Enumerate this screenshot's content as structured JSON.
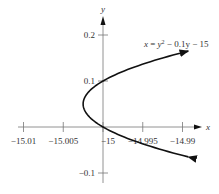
{
  "chart_data": {
    "type": "line",
    "title": "",
    "equation_label": "x = y² − 0.1y − 15",
    "xlabel": "x",
    "ylabel": "y",
    "xlim": [
      -15.0125,
      -14.988
    ],
    "ylim": [
      -0.12,
      0.24
    ],
    "x_ticks": [
      -15.01,
      -15.005,
      -15,
      -14.995,
      -14.99
    ],
    "x_tick_labels": [
      "−15.01",
      "−15.005",
      "−15",
      "−14.995",
      "−14.99"
    ],
    "y_ticks": [
      -0.1,
      0.1,
      0.2
    ],
    "y_tick_labels": [
      "−0.1",
      "0.1",
      "0.2"
    ],
    "grid": false,
    "legend": null,
    "series": [
      {
        "name": "x = y^2 - 0.1y - 15",
        "y_range": [
          -0.065,
          0.165
        ],
        "points": [
          {
            "y": -0.065,
            "x": -14.9893
          },
          {
            "y": 0.0,
            "x": -15.0
          },
          {
            "y": 0.05,
            "x": -15.0025
          },
          {
            "y": 0.1,
            "x": -15.0
          },
          {
            "y": 0.165,
            "x": -14.9893
          }
        ]
      }
    ]
  }
}
